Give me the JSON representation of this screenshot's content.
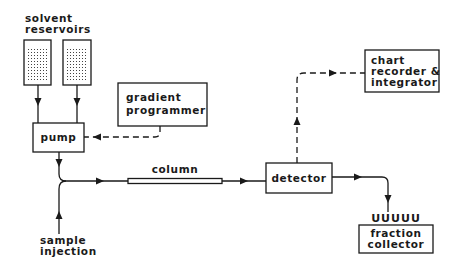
{
  "diagram": {
    "colors": {
      "ink": "#1a1a1a",
      "background": "#ffffff"
    },
    "nodes": {
      "solvent_reservoirs": {
        "label_line1": "solvent",
        "label_line2": "reservoirs",
        "count": 2
      },
      "pump": {
        "label": "pump"
      },
      "gradient_programmer": {
        "label_line1": "gradient",
        "label_line2": "programmer"
      },
      "column": {
        "label": "column"
      },
      "detector": {
        "label": "detector"
      },
      "chart_recorder": {
        "label_line1": "chart",
        "label_line2": "recorder &",
        "label_line3": "integrator"
      },
      "fraction_collector": {
        "label_line1": "fraction",
        "label_line2": "collector",
        "tubes": "UUUUU"
      },
      "sample_injection": {
        "label_line1": "sample",
        "label_line2": "injection"
      }
    },
    "edges": [
      {
        "from": "solvent_reservoir_1",
        "to": "pump",
        "style": "solid"
      },
      {
        "from": "solvent_reservoir_2",
        "to": "pump",
        "style": "solid"
      },
      {
        "from": "gradient_programmer",
        "to": "pump",
        "style": "dashed"
      },
      {
        "from": "pump",
        "to": "column",
        "style": "solid"
      },
      {
        "from": "sample_injection",
        "to": "column",
        "style": "solid"
      },
      {
        "from": "column",
        "to": "detector",
        "style": "solid"
      },
      {
        "from": "detector",
        "to": "chart_recorder",
        "style": "dashed"
      },
      {
        "from": "detector",
        "to": "fraction_collector",
        "style": "solid"
      }
    ]
  }
}
